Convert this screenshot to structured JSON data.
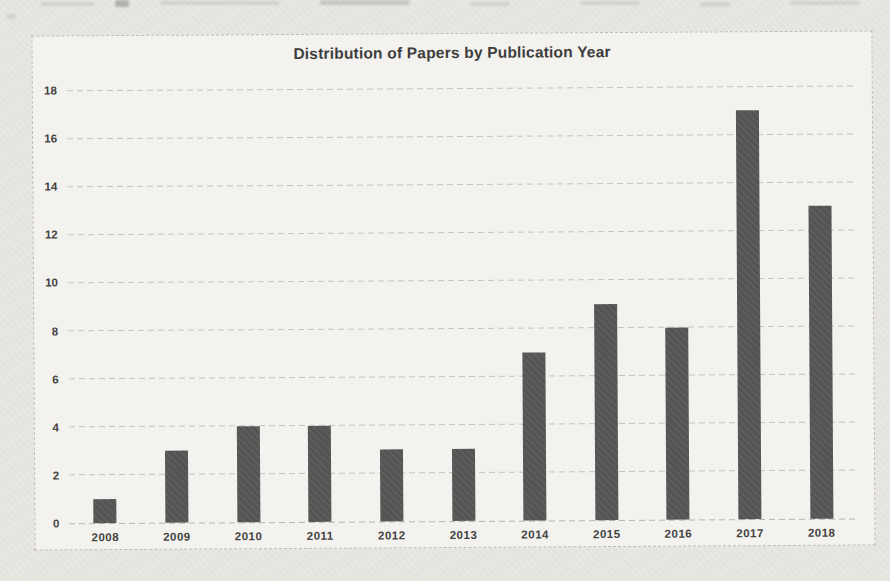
{
  "chart_data": {
    "type": "bar",
    "title": "Distribution of Papers by Publication Year",
    "categories": [
      "2008",
      "2009",
      "2010",
      "2011",
      "2012",
      "2013",
      "2014",
      "2015",
      "2016",
      "2017",
      "2018"
    ],
    "values": [
      1,
      3,
      4,
      4,
      3,
      3,
      7,
      9,
      8,
      17,
      13
    ],
    "xlabel": "",
    "ylabel": "",
    "ylim": [
      0,
      18
    ],
    "yticks": [
      0,
      2,
      4,
      6,
      8,
      10,
      12,
      14,
      16,
      18
    ],
    "grid": true,
    "legend": "none",
    "colors": {
      "bar": "#545454",
      "gridline": "#c6c3bd",
      "baseline": "#b7b4ae",
      "title_text": "#3d3d3d",
      "tick_text": "#434343",
      "chart_background": "#f3f2ee",
      "page_background": "#e8e6e1",
      "frame_border": "#bdbab4"
    }
  }
}
